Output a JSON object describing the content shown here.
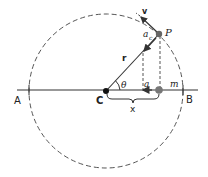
{
  "figure": {
    "type": "uniform circular motion projection (simple harmonic motion)",
    "colors": {
      "line": "#333333",
      "dashed": "#555555",
      "mass": "#666666",
      "center": "#111111",
      "background": "#ffffff"
    },
    "labels": {
      "A": "A",
      "B": "B",
      "C": "C",
      "P": "P",
      "r": "r",
      "theta": "θ",
      "v": "v",
      "a_c": "a",
      "a_c_sub": "c",
      "a": "a",
      "m": "m",
      "x": "x"
    },
    "geometry": {
      "center": [
        106,
        91
      ],
      "radius": 77,
      "point_P": [
        159,
        34
      ],
      "mass_m": [
        159,
        90
      ],
      "axis_y": 90
    }
  }
}
